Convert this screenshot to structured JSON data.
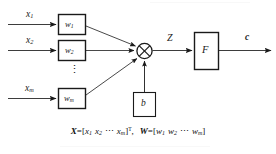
{
  "figure": {
    "type": "neuron-model-diagram",
    "title": "",
    "stroke_color": "#1a1a1a",
    "box_fill": "#ffffff",
    "background": "#ffffff"
  },
  "inputs": [
    {
      "name": "input-1",
      "label": "x",
      "subscript": "1"
    },
    {
      "name": "input-2",
      "label": "x",
      "subscript": "2"
    },
    {
      "name": "input-m",
      "label": "x",
      "subscript": "m"
    }
  ],
  "weights": [
    {
      "name": "weight-1",
      "label": "w",
      "subscript": "1"
    },
    {
      "name": "weight-2",
      "label": "w",
      "subscript": "2"
    },
    {
      "name": "weight-m",
      "label": "w",
      "subscript": "m"
    }
  ],
  "vertical_ellipsis": "⋮",
  "summation_node": {
    "label": "⊗",
    "semantic": "circled-times-operator"
  },
  "intermediate": {
    "label": "Z"
  },
  "bias": {
    "label": "b"
  },
  "activation": {
    "label": "F"
  },
  "output": {
    "label": "c"
  },
  "formula": {
    "x_vector": "X=[x1 x2 ⋯ xm]T",
    "w_vector": "W=[w1 w2 ⋯ wm]",
    "separator": ",",
    "x_var": "X",
    "w_var": "W",
    "equals": "=",
    "bracket_open": "[",
    "bracket_close": "]",
    "dots": "⋯",
    "transpose": "T",
    "x_sym": "x",
    "w_sym": "w",
    "sub1": "1",
    "sub2": "2",
    "subm": "m"
  }
}
